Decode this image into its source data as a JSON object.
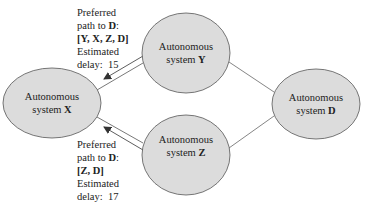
{
  "nodes": {
    "x": {
      "line1": "Autonomous",
      "prefix": "system ",
      "id": "X"
    },
    "y": {
      "line1": "Autonomous",
      "prefix": "system ",
      "id": "Y"
    },
    "z": {
      "line1": "Autonomous",
      "prefix": "system ",
      "id": "Z"
    },
    "d": {
      "line1": "Autonomous",
      "prefix": "system ",
      "id": "D"
    }
  },
  "annotations": {
    "from_y": {
      "line1": "Preferred",
      "line2_prefix": "path to ",
      "line2_dest": "D",
      "line2_suffix": ":",
      "path": "[Y, X, Z, D]",
      "line4": "Estimated",
      "delay_label": "delay:",
      "delay_value": "15"
    },
    "from_z": {
      "line1": "Preferred",
      "line2_prefix": "path to ",
      "line2_dest": "D",
      "line2_suffix": ":",
      "path": "[Z, D]",
      "line4": "Estimated",
      "delay_label": "delay:",
      "delay_value": "17"
    }
  },
  "colors": {
    "node_fill": "#dcdcdc",
    "stroke": "#555555"
  }
}
